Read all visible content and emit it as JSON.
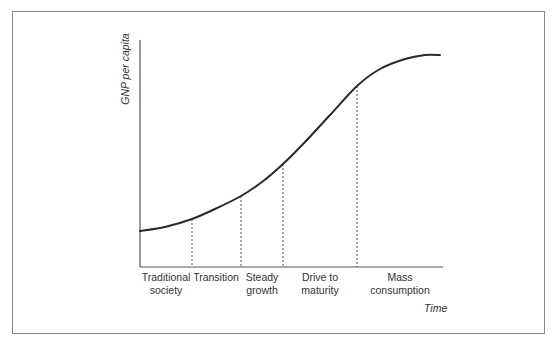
{
  "chart_data": {
    "type": "line",
    "title": "",
    "xlabel": "Time",
    "ylabel": "GNP per capita",
    "grid": false,
    "legend": null,
    "stages": [
      {
        "label_line1": "Traditional",
        "label_line2": "society"
      },
      {
        "label_line1": "Transition",
        "label_line2": ""
      },
      {
        "label_line1": "Steady",
        "label_line2": "growth"
      },
      {
        "label_line1": "Drive to",
        "label_line2": "maturity"
      },
      {
        "label_line1": "Mass",
        "label_line2": "consumption"
      }
    ],
    "stage_boundaries_x_px": [
      192,
      241,
      283,
      357
    ],
    "curve_points_px": [
      [
        140,
        231
      ],
      [
        165,
        227
      ],
      [
        192,
        219
      ],
      [
        215,
        209
      ],
      [
        241,
        196
      ],
      [
        262,
        182
      ],
      [
        283,
        164
      ],
      [
        305,
        142
      ],
      [
        330,
        115
      ],
      [
        357,
        86
      ],
      [
        380,
        69
      ],
      [
        405,
        59
      ],
      [
        425,
        55
      ],
      [
        440,
        55
      ]
    ],
    "axes": {
      "origin_px": [
        140,
        267
      ],
      "y_top_px": 40,
      "x_end_px": 443
    }
  },
  "labels": {
    "y_axis": "GNP per capita",
    "x_axis": "Time"
  }
}
